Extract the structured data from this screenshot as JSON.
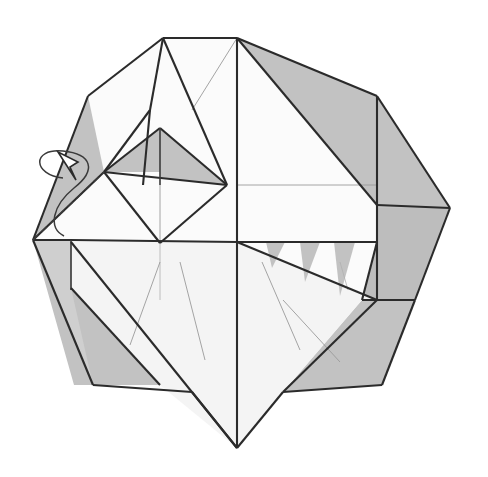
{
  "document": {
    "kind": "origami-folding-diagram",
    "title": "Origami fold step diagram",
    "background_color": "#ffffff",
    "width": 488,
    "height": 477
  },
  "palette": {
    "paper_front": "#fbfbfb",
    "paper_front_alt": "#f4f4f4",
    "paper_back": "#c2c2c2",
    "paper_back_dark": "#bdbdbd",
    "paper_back_light": "#cfcfcf",
    "edge_major": "#2b2b2b",
    "edge_medium": "#3a3a3a",
    "edge_thin": "#9a9a9a",
    "edge_hair": "#b0b0b0",
    "arrow_stroke": "#3a3a3a",
    "arrow_fill": "#ffffff"
  },
  "figure": {
    "outline_points": "88,96 163,38 237,38 377,96 450,208 415,300 382,385 283,392 237,448 192,392 93,385 33,240",
    "facets": [
      {
        "id": "back-upper-left-wing",
        "name": "back-upper-left-wing",
        "shade": "facet-gray",
        "points": "88,96 163,38 150,110 143,185 104,172 33,240"
      },
      {
        "id": "back-left-lower-band",
        "name": "back-left-lower-band",
        "shade": "facet-gray",
        "points": "33,240 71,240 71,290 93,385 74,385"
      },
      {
        "id": "back-left-body",
        "name": "back-left-body",
        "shade": "facet-gray-l",
        "points": "33,240 71,240 71,290 160,385 93,385"
      },
      {
        "id": "back-left-inner-wedge",
        "name": "back-left-inner-wedge",
        "shade": "facet-gray",
        "points": "71,288 160,385 93,385"
      },
      {
        "id": "front-upper-left-flap",
        "name": "front-upper-left-flap",
        "shade": "facet-white",
        "points": "163,38 150,110 104,172 88,96"
      },
      {
        "id": "front-left-inner-flap",
        "name": "front-left-inner-flap",
        "shade": "facet-white",
        "points": "163,38 227,185 104,172 150,110"
      },
      {
        "id": "front-top-center-panel",
        "name": "front-top-center-panel",
        "shade": "facet-white",
        "points": "163,38 237,38 237,185 227,185"
      },
      {
        "id": "back-top-right-wing",
        "name": "back-top-right-wing",
        "shade": "facet-gray",
        "points": "237,38 377,96 377,205 377,205"
      },
      {
        "id": "front-right-large-panel",
        "name": "front-right-large-panel",
        "shade": "facet-white",
        "points": "237,38 377,205 377,242 237,242"
      },
      {
        "id": "back-right-upper",
        "name": "back-right-upper",
        "shade": "facet-gray",
        "points": "377,96 450,208 377,208 377,96"
      },
      {
        "id": "back-right-lower",
        "name": "back-right-lower",
        "shade": "facet-gray-d",
        "points": "377,208 450,208 415,300 362,300 377,242"
      },
      {
        "id": "back-right-skirt",
        "name": "back-right-skirt",
        "shade": "facet-gray",
        "points": "362,300 415,300 382,385 283,392"
      },
      {
        "id": "diamond-top-left-gray",
        "name": "diamond-top-left-gray",
        "shade": "facet-gray",
        "points": "104,172 160,128 160,172"
      },
      {
        "id": "diamond-top-right-gray",
        "name": "diamond-top-right-gray",
        "shade": "facet-gray",
        "points": "160,128 227,185 160,185"
      },
      {
        "id": "diamond-lower-white",
        "name": "diamond-lower-white",
        "shade": "facet-white",
        "points": "104,172 227,185 160,243"
      },
      {
        "id": "front-bottom-big-kite",
        "name": "front-bottom-big-kite",
        "shade": "facet-offwhite",
        "points": "71,242 237,242 283,392 237,448 160,385 71,288"
      },
      {
        "id": "front-bottom-right-kite",
        "name": "front-bottom-right-kite",
        "shade": "facet-offwhite",
        "points": "237,242 377,300 362,300 283,392 237,448"
      },
      {
        "id": "tooth-1",
        "name": "tooth-1",
        "shade": "facet-gray",
        "points": "266,242 285,242 272,268"
      },
      {
        "id": "tooth-2",
        "name": "tooth-2",
        "shade": "facet-gray",
        "points": "300,242 320,242 305,282"
      },
      {
        "id": "tooth-3",
        "name": "tooth-3",
        "shade": "facet-gray",
        "points": "334,242 355,242 340,296"
      }
    ],
    "major_edges": [
      "M88,96 L163,38",
      "M163,38 L237,38",
      "M237,38 L377,96",
      "M377,96 L450,208",
      "M450,208 L415,300",
      "M415,300 L382,385",
      "M382,385 L283,392",
      "M283,392 L237,448",
      "M237,448 L192,392",
      "M192,392 L93,385",
      "M93,385 L33,240",
      "M33,240 L88,96",
      "M163,38 L150,110",
      "M150,110 L104,172",
      "M163,38 L227,185",
      "M150,110 L143,185",
      "M237,38 L237,242",
      "M237,38 L377,205",
      "M377,96 L377,300",
      "M377,205 L450,208",
      "M377,242 L362,300",
      "M362,300 L415,300",
      "M104,172 L160,128",
      "M160,128 L227,185",
      "M104,172 L227,185",
      "M104,172 L160,243",
      "M160,243 L227,185",
      "M160,128 L160,185",
      "M33,240 L71,240",
      "M71,240 L237,242",
      "M237,242 L377,242",
      "M71,240 L71,290",
      "M71,288 L160,385",
      "M33,240 L104,172",
      "M237,242 L377,300",
      "M377,300 L283,392",
      "M237,242 L237,448",
      "M71,242 L237,448"
    ],
    "thin_creases": [
      "M237,38 L192,110",
      "M237,185 L377,185",
      "M160,185 L160,243",
      "M160,242 L160,300",
      "M71,290 L71,242",
      "M160,262 L130,345",
      "M237,250 L237,430",
      "M262,262 L300,350",
      "M283,300 L340,362",
      "M180,262 L205,360",
      "M340,262 L348,290"
    ],
    "dashed_creases": [
      "M33,240 L104,172"
    ],
    "arrow": {
      "name": "fold-rotation-arrow",
      "curve_path": "M63,178 C33,175 31,148 63,151 C92,154 97,170 74,188 C52,206 48,228 64,236",
      "head_path": "M58,152 L78,162 L70,167 L76,180 Z"
    }
  }
}
